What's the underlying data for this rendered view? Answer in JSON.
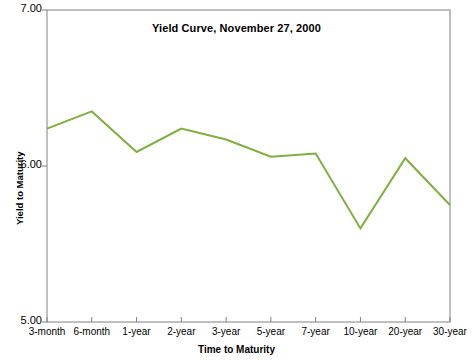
{
  "chart_data": {
    "type": "line",
    "title": "Yield Curve, November 27, 2000",
    "xlabel": "Time to Maturity",
    "ylabel": "Yield to Maturity",
    "categories": [
      "3-month",
      "6-month",
      "1-year",
      "2-year",
      "3-year",
      "5-year",
      "7-year",
      "10-year",
      "20-year",
      "30-year"
    ],
    "values": [
      6.24,
      6.35,
      6.09,
      6.24,
      6.17,
      6.06,
      6.08,
      5.6,
      6.05,
      5.75
    ],
    "series": [
      {
        "name": "Yield to Maturity",
        "values": [
          6.24,
          6.35,
          6.09,
          6.24,
          6.17,
          6.06,
          6.08,
          5.6,
          6.05,
          5.75
        ]
      }
    ],
    "ylim": [
      5.0,
      7.0
    ],
    "ytick_labels": [
      "7.00",
      "6.00",
      "5.00"
    ],
    "ytick_values": [
      7.0,
      6.0,
      5.0
    ],
    "grid": false,
    "legend": false,
    "line_color": "#7FAF3F",
    "axis_color": "#808080",
    "background": "#FFFFFF"
  }
}
